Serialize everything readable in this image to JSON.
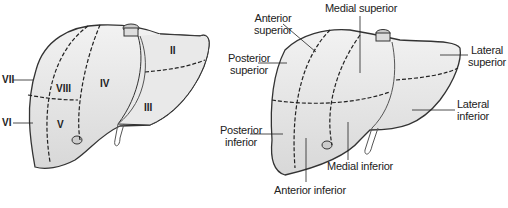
{
  "left_diagram": {
    "title": "Couinaud segments",
    "segments": [
      {
        "id": "II",
        "label": "II"
      },
      {
        "id": "III",
        "label": "III"
      },
      {
        "id": "IV",
        "label": "IV"
      },
      {
        "id": "V",
        "label": "V"
      },
      {
        "id": "VI",
        "label": "VI"
      },
      {
        "id": "VII",
        "label": "VII"
      },
      {
        "id": "VIII",
        "label": "VIII"
      }
    ]
  },
  "right_diagram": {
    "title": "Anatomical subsegments",
    "labels": {
      "anterior_superior": "Anterior superior",
      "anterior_superior_l1": "Anterior",
      "anterior_superior_l2": "superior",
      "posterior_superior_l1": "Posterior",
      "posterior_superior_l2": "superior",
      "medial_superior": "Medial superior",
      "lateral_superior_l1": "Lateral",
      "lateral_superior_l2": "superior",
      "lateral_inferior_l1": "Lateral",
      "lateral_inferior_l2": "inferior",
      "posterior_inferior_l1": "Posterior",
      "posterior_inferior_l2": "inferior",
      "medial_inferior": "Medial inferior",
      "anterior_inferior": "Anterior inferior"
    }
  },
  "colors": {
    "liver_fill": "#e6e6e6",
    "outline": "#333333",
    "text": "#222222"
  }
}
